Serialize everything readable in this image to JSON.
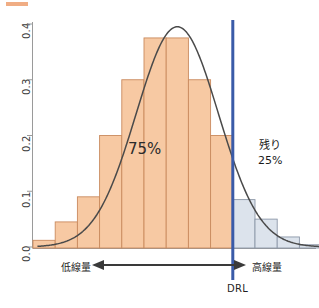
{
  "legend": {
    "swatch_color": "#f0ad84",
    "label": "",
    "label_right": ""
  },
  "annotations": {
    "inside_percent": "75%",
    "right_line1": "残り",
    "right_line2": "25%",
    "low_dose": "低線量",
    "high_dose": "高線量",
    "drl": "DRL"
  },
  "colors": {
    "bar_fill_below": "#f7c9a3",
    "bar_stroke_below": "#c98a5e",
    "bar_fill_above": "#dce3ec",
    "bar_stroke_above": "#8c97a8",
    "curve": "#4a4a4a",
    "drl_line": "#3a5ba8",
    "axis": "#9a9a9a",
    "arrow": "#3a3a3a"
  },
  "chart_data": {
    "type": "bar",
    "title": "",
    "subtitle": "",
    "xlabel": "",
    "ylabel": "",
    "ylim": [
      0.0,
      0.42
    ],
    "yticks": [
      0.0,
      0.1,
      0.2,
      0.3,
      0.4
    ],
    "ytick_labels": [
      "0.0",
      "0.1",
      "0.2",
      "0.3",
      "0.4"
    ],
    "xlim": [
      0,
      13
    ],
    "grid": false,
    "legend_position": "top",
    "bin_index": [
      0,
      1,
      2,
      3,
      4,
      5,
      6,
      7,
      8,
      9,
      10,
      11,
      12
    ],
    "values": [
      0.012,
      0.045,
      0.09,
      0.2,
      0.3,
      0.375,
      0.375,
      0.3,
      0.2,
      0.085,
      0.05,
      0.018,
      0.004
    ],
    "bar_group": [
      "below",
      "below",
      "below",
      "below",
      "below",
      "below",
      "below",
      "below",
      "below",
      "above",
      "above",
      "above",
      "above"
    ],
    "drl_bin_boundary": 9,
    "drl_fraction_below": "75%",
    "drl_fraction_above": "25%",
    "overlay_curve": {
      "type": "line",
      "name": "normal-distribution",
      "mean_bin": 6.0,
      "peak_value": 0.395,
      "sigma_bins": 1.85
    }
  }
}
